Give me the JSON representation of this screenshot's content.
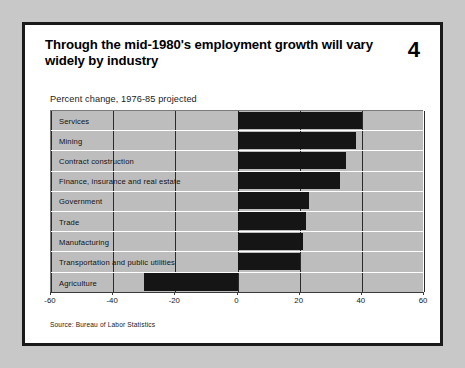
{
  "slide": {
    "title": "Through the mid-1980's employment growth will vary widely by industry",
    "number": "4",
    "subtitle": "Percent change, 1976-85 projected",
    "source": "Source: Bureau of Labor Statistics"
  },
  "colors": {
    "page_background": "#c8c8c8",
    "slide_background": "#ffffff",
    "slide_border": "#1a1a1a",
    "plot_background": "#bdbdbd",
    "bar_fill": "#151515",
    "gridline": "#2b2b2b",
    "row_separator": "#ffffff",
    "text": "#000000"
  },
  "chart_data": {
    "type": "bar",
    "orientation": "horizontal",
    "title": "Through the mid-1980's employment growth will vary widely by industry",
    "subtitle": "Percent change, 1976-85 projected",
    "xlabel": "",
    "ylabel": "",
    "xlim": [
      -60,
      60
    ],
    "ticks": [
      -60,
      -40,
      -20,
      0,
      20,
      40,
      60
    ],
    "tick_labels": [
      "-60",
      "-40",
      "-20",
      "0",
      "20",
      "40",
      "60"
    ],
    "grid": true,
    "legend": false,
    "source": "Source: Bureau of Labor Statistics",
    "categories": [
      "Services",
      "Mining",
      "Contract construction",
      "Finance, insurance and real estate",
      "Government",
      "Trade",
      "Manufacturing",
      "Transportation and public utilities",
      "Agriculture"
    ],
    "values": [
      40,
      38,
      35,
      33,
      23,
      22,
      21,
      20,
      -30
    ]
  }
}
